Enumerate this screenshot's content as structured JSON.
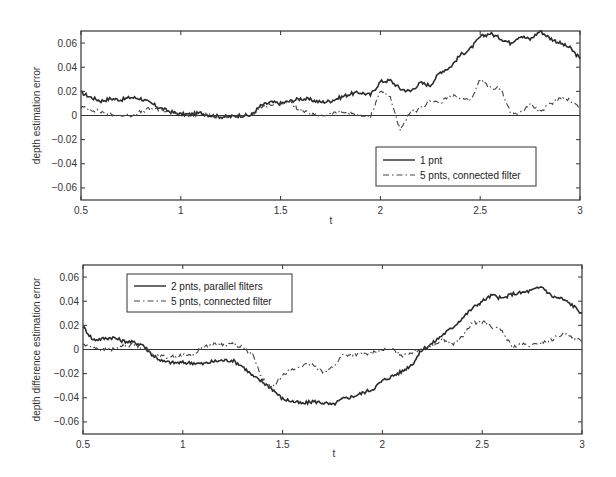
{
  "chart_data": [
    {
      "type": "line",
      "title": "",
      "xlabel": "t",
      "ylabel": "depth estimation error",
      "xlim": [
        0.5,
        3
      ],
      "ylim": [
        -0.07,
        0.07
      ],
      "xticks": [
        "0.5",
        "1",
        "1.5",
        "2",
        "2.5",
        "3"
      ],
      "yticks": [
        "0.06",
        "0.04",
        "0.02",
        "0",
        "-0.02",
        "-0.04",
        "-0.06"
      ],
      "grid": false,
      "legend_position": "lower right",
      "x": [
        0.5,
        0.55,
        0.6,
        0.65,
        0.7,
        0.75,
        0.8,
        0.85,
        0.9,
        0.95,
        1.0,
        1.05,
        1.1,
        1.15,
        1.2,
        1.25,
        1.3,
        1.35,
        1.4,
        1.45,
        1.5,
        1.55,
        1.6,
        1.65,
        1.7,
        1.75,
        1.8,
        1.85,
        1.9,
        1.95,
        2.0,
        2.05,
        2.1,
        2.15,
        2.2,
        2.25,
        2.3,
        2.35,
        2.4,
        2.45,
        2.5,
        2.55,
        2.6,
        2.65,
        2.7,
        2.75,
        2.8,
        2.85,
        2.9,
        2.95,
        3.0
      ],
      "series": [
        {
          "name": "1 pnt",
          "style": "solid",
          "values": [
            0.019,
            0.015,
            0.012,
            0.014,
            0.013,
            0.015,
            0.014,
            0.01,
            0.006,
            0.003,
            0.001,
            0.001,
            0.002,
            0.0,
            -0.001,
            -0.001,
            0.0,
            0.0,
            0.008,
            0.011,
            0.01,
            0.012,
            0.014,
            0.013,
            0.011,
            0.012,
            0.015,
            0.018,
            0.019,
            0.017,
            0.028,
            0.029,
            0.022,
            0.02,
            0.027,
            0.025,
            0.036,
            0.04,
            0.05,
            0.055,
            0.065,
            0.068,
            0.064,
            0.06,
            0.066,
            0.063,
            0.07,
            0.064,
            0.06,
            0.056,
            0.047
          ]
        },
        {
          "name": "5 pnts, connected filter",
          "style": "dash-dot",
          "values": [
            0.007,
            0.005,
            0.003,
            0.001,
            0.0,
            0.0,
            0.003,
            0.006,
            0.004,
            0.003,
            0.001,
            0.0,
            0.001,
            0.0,
            -0.001,
            -0.001,
            0.0,
            0.0,
            0.007,
            0.009,
            0.01,
            0.011,
            0.004,
            0.001,
            0.0,
            0.001,
            0.003,
            0.002,
            0.0,
            -0.001,
            0.021,
            0.015,
            -0.013,
            0.003,
            0.005,
            0.013,
            0.01,
            0.017,
            0.014,
            0.012,
            0.03,
            0.023,
            0.023,
            0.003,
            0.002,
            0.01,
            0.003,
            0.009,
            0.015,
            0.013,
            0.006
          ]
        }
      ]
    },
    {
      "type": "line",
      "title": "",
      "xlabel": "t",
      "ylabel": "depth difference estimation error",
      "xlim": [
        0.5,
        3
      ],
      "ylim": [
        -0.07,
        0.07
      ],
      "xticks": [
        "0.5",
        "1",
        "1.5",
        "2",
        "2.5",
        "3"
      ],
      "yticks": [
        "0.06",
        "0.04",
        "0.02",
        "0",
        "-0.02",
        "-0.04",
        "-0.06"
      ],
      "grid": false,
      "legend_position": "upper left",
      "x": [
        0.5,
        0.55,
        0.6,
        0.65,
        0.7,
        0.75,
        0.8,
        0.85,
        0.9,
        0.95,
        1.0,
        1.05,
        1.1,
        1.15,
        1.2,
        1.25,
        1.3,
        1.35,
        1.4,
        1.45,
        1.5,
        1.55,
        1.6,
        1.65,
        1.7,
        1.75,
        1.8,
        1.85,
        1.9,
        1.95,
        2.0,
        2.05,
        2.1,
        2.15,
        2.2,
        2.25,
        2.3,
        2.35,
        2.4,
        2.45,
        2.5,
        2.55,
        2.6,
        2.65,
        2.7,
        2.75,
        2.8,
        2.85,
        2.9,
        2.95,
        3.0
      ],
      "series": [
        {
          "name": "2 pnts, parallel filters",
          "style": "solid",
          "values": [
            0.019,
            0.008,
            0.009,
            0.01,
            0.007,
            0.006,
            0.004,
            -0.005,
            -0.01,
            -0.011,
            -0.011,
            -0.011,
            -0.012,
            -0.01,
            -0.009,
            -0.009,
            -0.014,
            -0.022,
            -0.027,
            -0.033,
            -0.041,
            -0.043,
            -0.045,
            -0.043,
            -0.044,
            -0.046,
            -0.041,
            -0.039,
            -0.036,
            -0.033,
            -0.026,
            -0.022,
            -0.018,
            -0.012,
            0.0,
            0.005,
            0.012,
            0.018,
            0.026,
            0.034,
            0.04,
            0.045,
            0.042,
            0.046,
            0.047,
            0.049,
            0.052,
            0.044,
            0.042,
            0.037,
            0.03
          ]
        },
        {
          "name": "5 pnts, connected filter",
          "style": "dash-dot",
          "values": [
            0.004,
            0.002,
            0.0,
            0.0,
            0.003,
            0.004,
            0.002,
            -0.004,
            -0.006,
            -0.006,
            -0.005,
            -0.005,
            0.002,
            0.004,
            0.004,
            0.005,
            0.002,
            -0.005,
            -0.025,
            -0.032,
            -0.02,
            -0.017,
            -0.013,
            -0.013,
            -0.018,
            -0.015,
            -0.005,
            -0.004,
            -0.004,
            -0.003,
            0.0,
            0.0,
            -0.005,
            -0.002,
            0.001,
            0.003,
            0.009,
            0.004,
            0.01,
            0.022,
            0.023,
            0.019,
            0.015,
            0.002,
            0.004,
            0.003,
            0.006,
            0.008,
            0.013,
            0.011,
            0.006
          ]
        }
      ]
    }
  ],
  "plots": [
    {
      "ylabel": "depth estimation error",
      "xlabel": "t",
      "legend": [
        "1 pnt",
        "5 pnts, connected filter"
      ]
    },
    {
      "ylabel": "depth difference estimation error",
      "xlabel": "t",
      "legend": [
        "2 pnts, parallel filters",
        "5 pnts, connected filter"
      ]
    }
  ],
  "colors": {
    "line": "#2b2b2b",
    "axis": "#333333",
    "background": "#ffffff"
  }
}
